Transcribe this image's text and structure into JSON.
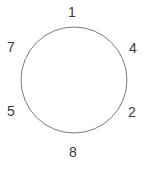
{
  "figure": {
    "type": "circle-node-diagram",
    "background_color": "#ffffff",
    "stroke_color": "#7a7a7a",
    "text_color": "#3a3a3a"
  },
  "circle": {
    "center_x": 74,
    "center_y": 80,
    "radius": 53,
    "stroke_width": 1
  },
  "labels": [
    {
      "text": "1",
      "x": 72,
      "y": 12,
      "position": "top"
    },
    {
      "text": "4",
      "x": 133,
      "y": 48,
      "position": "upper-right"
    },
    {
      "text": "2",
      "x": 132,
      "y": 112,
      "position": "lower-right"
    },
    {
      "text": "8",
      "x": 73,
      "y": 152,
      "position": "bottom"
    },
    {
      "text": "5",
      "x": 11,
      "y": 111,
      "position": "lower-left"
    },
    {
      "text": "7",
      "x": 11,
      "y": 47,
      "position": "upper-left"
    }
  ]
}
